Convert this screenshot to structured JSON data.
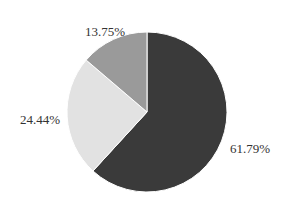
{
  "chart_data": {
    "type": "pie",
    "title": "",
    "start_angle_deg": 90,
    "direction": "clockwise",
    "slices": [
      {
        "label": "61.79%",
        "value": 61.79,
        "color": "#3a3a3a"
      },
      {
        "label": "24.44%",
        "value": 24.44,
        "color": "#e2e2e2"
      },
      {
        "label": "13.75%",
        "value": 13.75,
        "color": "#9a9a9a"
      }
    ],
    "legend": "none",
    "center": [
      147,
      112
    ],
    "radius": 80
  },
  "labels": {
    "slice_0": "61.79%",
    "slice_1": "24.44%",
    "slice_2": "13.75%"
  }
}
